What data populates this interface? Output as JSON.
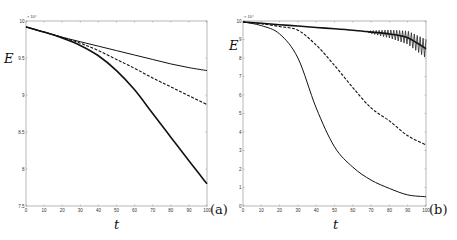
{
  "chart_data": [
    {
      "type": "line",
      "panel_label": "(a)",
      "xlabel": "t",
      "ylabel": "E",
      "y_multiplier": "x 10^4",
      "xlim": [
        0,
        100
      ],
      "ylim": [
        7.5,
        10
      ],
      "x_ticks": [
        "0",
        "10",
        "20",
        "30",
        "40",
        "50",
        "60",
        "70",
        "80",
        "90",
        "100"
      ],
      "y_ticks": [
        "7.5",
        "8",
        "8.5",
        "9",
        "9.5",
        "10"
      ],
      "grid": false,
      "x": [
        0,
        10,
        20,
        30,
        40,
        50,
        60,
        70,
        80,
        90,
        100
      ],
      "series": [
        {
          "name": "solid",
          "style": "solid",
          "values": [
            9.92,
            9.85,
            9.77,
            9.67,
            9.53,
            9.33,
            9.07,
            8.75,
            8.43,
            8.11,
            7.8
          ]
        },
        {
          "name": "dashed",
          "style": "dashed",
          "values": [
            9.92,
            9.85,
            9.78,
            9.7,
            9.6,
            9.48,
            9.36,
            9.23,
            9.11,
            8.99,
            8.87
          ]
        },
        {
          "name": "dash-dot",
          "style": "dashdot",
          "values": [
            9.92,
            9.85,
            9.78,
            9.72,
            9.66,
            9.6,
            9.54,
            9.48,
            9.42,
            9.37,
            9.33
          ]
        }
      ]
    },
    {
      "type": "line",
      "panel_label": "(b)",
      "xlabel": "t",
      "ylabel": "E",
      "y_multiplier": "x 10^4",
      "xlim": [
        0,
        100
      ],
      "ylim": [
        0,
        10
      ],
      "x_ticks": [
        "0",
        "10",
        "20",
        "30",
        "40",
        "50",
        "60",
        "70",
        "80",
        "90",
        "100"
      ],
      "y_ticks": [
        "0",
        "1",
        "2",
        "3",
        "4",
        "5",
        "6",
        "7",
        "8",
        "9",
        "10"
      ],
      "grid": false,
      "x": [
        0,
        10,
        20,
        30,
        40,
        50,
        60,
        70,
        80,
        90,
        100
      ],
      "series": [
        {
          "name": "solid",
          "style": "solid (oscillating after t~70)",
          "values": [
            9.95,
            9.88,
            9.8,
            9.73,
            9.65,
            9.58,
            9.5,
            9.4,
            9.3,
            9.1,
            8.5
          ]
        },
        {
          "name": "dashed",
          "style": "dashed (noisy)",
          "values": [
            9.95,
            9.85,
            9.7,
            9.5,
            8.7,
            7.6,
            6.4,
            5.3,
            4.6,
            3.8,
            3.3
          ]
        },
        {
          "name": "dash-dot",
          "style": "dashdot",
          "values": [
            9.95,
            9.75,
            9.3,
            8.0,
            5.3,
            3.2,
            2.1,
            1.4,
            0.95,
            0.6,
            0.5
          ]
        }
      ]
    }
  ]
}
